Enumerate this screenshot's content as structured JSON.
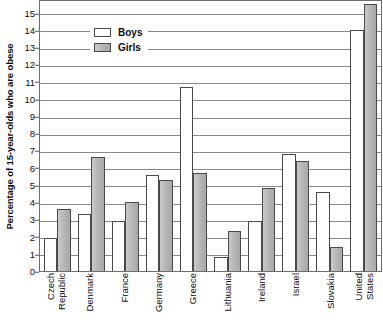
{
  "chart_data": {
    "type": "bar",
    "title": "",
    "subtitle": "",
    "xlabel": "",
    "ylabel": "Percentage of 15-year-olds who are obese",
    "ylim": [
      0,
      15.8
    ],
    "ytick_labels": [
      "0",
      "1",
      "2",
      "3",
      "4",
      "5",
      "6",
      "7",
      "8",
      "9",
      "10",
      "11",
      "12",
      "13",
      "14",
      "15"
    ],
    "ytick_values": [
      0,
      1,
      2,
      3,
      4,
      5,
      6,
      7,
      8,
      9,
      10,
      11,
      12,
      13,
      14,
      15
    ],
    "grid": true,
    "legend_position": "top-left-inside",
    "categories": [
      "Czech Republic",
      "Denmark",
      "France",
      "Germany",
      "Greece",
      "Lithuania",
      "Ireland",
      "Israel",
      "Slovakia",
      "United States"
    ],
    "category_label_lines": [
      [
        "Czech",
        "Republic"
      ],
      [
        "Denmark"
      ],
      [
        "France"
      ],
      [
        "Germany"
      ],
      [
        "Greece"
      ],
      [
        "Lithuania"
      ],
      [
        "Ireland"
      ],
      [
        "Israel"
      ],
      [
        "Slovakia"
      ],
      [
        "United",
        "States"
      ]
    ],
    "series": [
      {
        "name": "Boys",
        "color": "#ffffff",
        "values": [
          1.9,
          3.3,
          2.9,
          5.6,
          10.7,
          0.8,
          2.9,
          6.8,
          4.6,
          14.0
        ]
      },
      {
        "name": "Girls",
        "color": "#b4b4b4",
        "values": [
          3.6,
          6.6,
          4.0,
          5.3,
          5.7,
          2.3,
          4.8,
          6.4,
          1.4,
          15.5
        ]
      }
    ]
  },
  "legend": {
    "items": [
      {
        "label": "Boys",
        "swatch": "boys"
      },
      {
        "label": "Girls",
        "swatch": "girls"
      }
    ]
  }
}
